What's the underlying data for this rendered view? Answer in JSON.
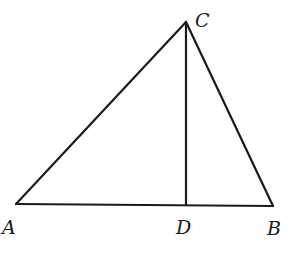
{
  "diagram": {
    "type": "geometry",
    "points": {
      "A": {
        "x": 16,
        "y": 204
      },
      "B": {
        "x": 273,
        "y": 206
      },
      "C": {
        "x": 186,
        "y": 22
      },
      "D": {
        "x": 186,
        "y": 205
      }
    },
    "segments": [
      {
        "name": "AC",
        "from": "A",
        "to": "C"
      },
      {
        "name": "CB",
        "from": "C",
        "to": "B"
      },
      {
        "name": "AB",
        "from": "A",
        "to": "B"
      },
      {
        "name": "CD",
        "from": "C",
        "to": "D"
      }
    ],
    "labels": {
      "A": "A",
      "B": "B",
      "C": "C",
      "D": "D"
    },
    "colors": {
      "stroke": "#1a1a1a",
      "background": "#ffffff"
    }
  }
}
